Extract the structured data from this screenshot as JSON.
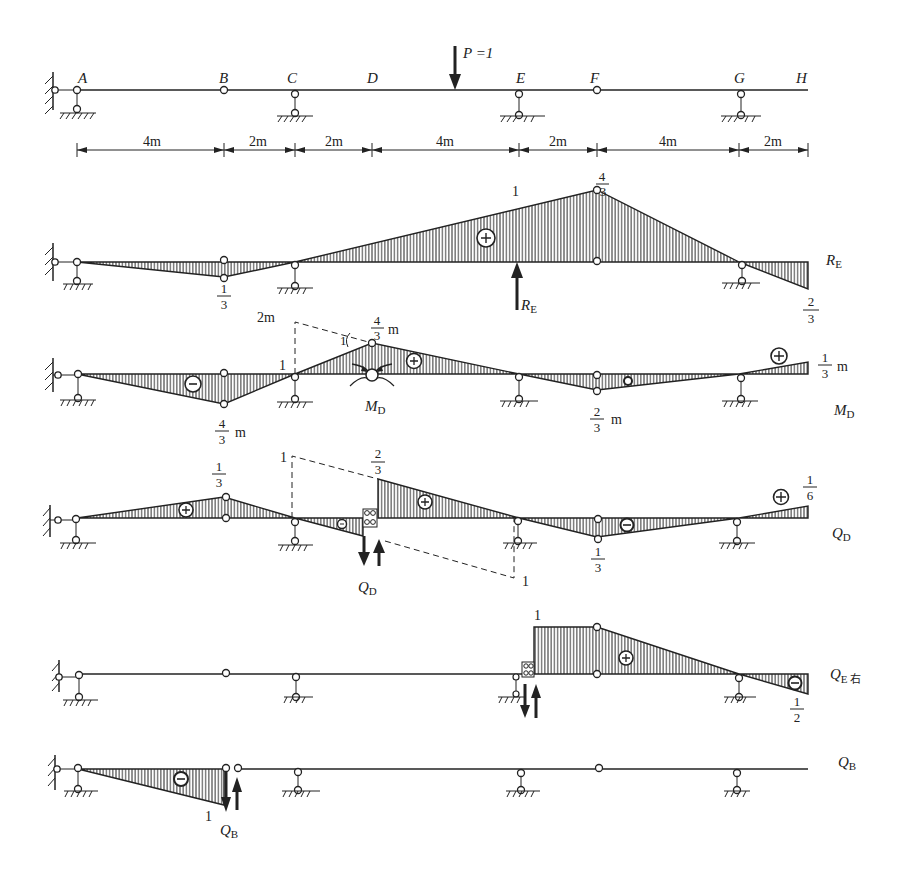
{
  "structure": {
    "points": [
      {
        "name": "A",
        "x_m": 0
      },
      {
        "name": "B",
        "x_m": 4
      },
      {
        "name": "C",
        "x_m": 6
      },
      {
        "name": "D",
        "x_m": 8
      },
      {
        "name": "E",
        "x_m": 12
      },
      {
        "name": "F",
        "x_m": 14
      },
      {
        "name": "G",
        "x_m": 18
      },
      {
        "name": "H",
        "x_m": 20
      }
    ],
    "hinges": [
      "B",
      "F"
    ],
    "supports": [
      "A",
      "C",
      "E",
      "G"
    ],
    "load_label": "P =1",
    "dimensions": [
      "4m",
      "2m",
      "2m",
      "4m",
      "2m",
      "4m",
      "2m"
    ]
  },
  "diagrams": [
    {
      "id": "RE",
      "label": "R",
      "label_sub": "E",
      "arrow_label": "R",
      "arrow_label_sub": "E",
      "ordinates": [
        {
          "x_m": 0,
          "value": 0
        },
        {
          "x_m": 4,
          "value": -0.3333,
          "text": "1/3"
        },
        {
          "x_m": 6,
          "value": 0
        },
        {
          "x_m": 12,
          "value": 1,
          "text": "1"
        },
        {
          "x_m": 14,
          "value": 1.3333,
          "text": "4/3"
        },
        {
          "x_m": 18,
          "value": 0
        },
        {
          "x_m": 20,
          "value": -0.6667,
          "text": "2/3"
        }
      ],
      "signs": [
        {
          "x_m": 10.5,
          "sign": "+"
        }
      ]
    },
    {
      "id": "MD",
      "label": "M",
      "label_sub": "D",
      "annotations": {
        "left_dashed": "2m",
        "unit_slope": "1",
        "left_one": "1"
      },
      "ordinates": [
        {
          "x_m": 0,
          "value": 0
        },
        {
          "x_m": 4,
          "value": -1.3333,
          "text": "4/3 m"
        },
        {
          "x_m": 6,
          "value": 0
        },
        {
          "x_m": 8,
          "value": 1.3333,
          "text": "4/3 m"
        },
        {
          "x_m": 12,
          "value": 0
        },
        {
          "x_m": 14,
          "value": -0.6667,
          "text": "2/3 m"
        },
        {
          "x_m": 18,
          "value": 0
        },
        {
          "x_m": 20,
          "value": 0.3333,
          "text": "1/3 m"
        }
      ],
      "signs": [
        {
          "x_m": 3.0,
          "sign": "-"
        },
        {
          "x_m": 9.1,
          "sign": "+"
        },
        {
          "x_m": 14.8,
          "sign": "-"
        },
        {
          "x_m": 19.2,
          "sign": "+"
        }
      ]
    },
    {
      "id": "QD",
      "label": "Q",
      "label_sub": "D",
      "annotations": {
        "dashed_left": "1",
        "dashed_right": "1"
      },
      "ordinates": [
        {
          "x_m": 0,
          "value": 0
        },
        {
          "x_m": 4,
          "value": 0.3333,
          "text": "1/3"
        },
        {
          "x_m": 6,
          "value": 0
        },
        {
          "x_m": 8,
          "value": -0.3333
        },
        {
          "x_m": 8,
          "value": 0.6667,
          "text": "2/3"
        },
        {
          "x_m": 12,
          "value": 0
        },
        {
          "x_m": 14,
          "value": -0.3333,
          "text": "1/3"
        },
        {
          "x_m": 18,
          "value": 0
        },
        {
          "x_m": 20,
          "value": 0.1667,
          "text": "1/6"
        }
      ],
      "signs": [
        {
          "x_m": 3.0,
          "sign": "+"
        },
        {
          "x_m": 7.3,
          "sign": "-"
        },
        {
          "x_m": 9.4,
          "sign": "+"
        },
        {
          "x_m": 15.0,
          "sign": "-"
        },
        {
          "x_m": 19.2,
          "sign": "+"
        }
      ]
    },
    {
      "id": "QE_right",
      "label": "Q",
      "label_sub": "E 右",
      "ordinates": [
        {
          "x_m": 12,
          "value": 0
        },
        {
          "x_m": 12,
          "value": 1,
          "text": "1"
        },
        {
          "x_m": 14,
          "value": 1
        },
        {
          "x_m": 18,
          "value": 0
        },
        {
          "x_m": 20,
          "value": -0.5,
          "text": "1/2"
        }
      ],
      "signs": [
        {
          "x_m": 15.0,
          "sign": "+"
        },
        {
          "x_m": 19.5,
          "sign": "-"
        }
      ]
    },
    {
      "id": "QB",
      "label": "Q",
      "label_sub": "B",
      "arrow_label": "Q",
      "arrow_label_sub": "B",
      "ordinates": [
        {
          "x_m": 0,
          "value": 0
        },
        {
          "x_m": 4,
          "value": -1,
          "text": "1"
        }
      ],
      "signs": [
        {
          "x_m": 2.6,
          "sign": "-"
        }
      ]
    }
  ],
  "colors": {
    "ink": "#222222",
    "hatch": "#333333",
    "background": "#ffffff"
  }
}
